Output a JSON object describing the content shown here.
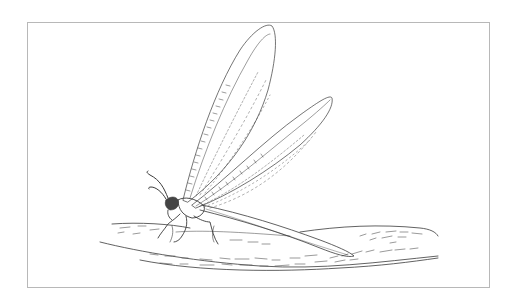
{
  "illustration": {
    "subject": "Antlion (lacewing-like insect) with wings raised, perched on a branch",
    "style": "pen-and-ink line drawing",
    "colors": {
      "line": "#3a3a3a",
      "frame": "#b8b8b8",
      "background": "#ffffff"
    },
    "frame": {
      "left": 27,
      "top": 22,
      "right": 490,
      "bottom": 288
    }
  }
}
